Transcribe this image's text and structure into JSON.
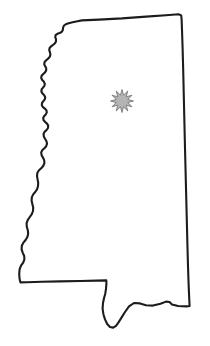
{
  "figure": {
    "kind": "map",
    "region_name": "Mississippi",
    "region_type": "state",
    "background_color": "#ffffff",
    "width": 210,
    "height": 346
  },
  "outline": {
    "name": "state-boundary",
    "stroke_color": "#1c1c1c",
    "fill_color": "#ffffff",
    "stroke_width": 2.1,
    "path": "M 77.5 21.2 L 82.0 20.4 L 99.0 19.6 L 122.0 18.4 L 146.0 16.6 L 166.0 15.2 L 178.5 14.3 L 181.2 15.4 L 181.6 19.0 L 182.0 30.0 L 182.6 48.0 L 183.2 70.0 L 183.8 96.0 L 184.4 122.0 L 185.0 148.0 L 185.6 172.0 L 186.2 196.0 L 186.8 220.0 L 187.4 244.0 L 188.0 266.0 L 188.6 284.0 L 189.2 298.0 L 189.6 306.0 L 186.5 306.4 L 178.0 306.0 L 172.0 304.5 L 169.5 302.0 L 166.0 301.6 L 160.5 303.8 L 153.0 305.6 L 146.0 305.2 L 140.0 303.4 L 134.0 303.0 L 129.0 306.4 L 125.0 312.0 L 121.5 317.6 L 118.5 322.4 L 116.0 325.8 L 113.2 327.6 L 110.0 327.0 L 107.2 324.0 L 105.0 319.4 L 103.4 314.2 L 102.6 308.6 L 103.0 303.0 L 104.0 298.2 L 105.2 294.0 L 106.0 288.8 L 106.4 283.6 L 106.3 280.4 L 97.0 280.6 L 80.0 281.0 L 60.0 281.4 L 42.0 281.8 L 27.0 282.2 L 20.5 282.4 L 19.6 279.0 L 19.2 274.0 L 19.6 269.4 L 21.0 265.6 L 23.2 262.6 L 24.4 259.4 L 24.2 256.0 L 22.8 252.8 L 21.6 249.4 L 21.8 245.8 L 23.4 242.6 L 25.6 240.0 L 27.4 237.0 L 28.2 233.6 L 27.8 230.2 L 26.8 226.8 L 26.6 223.2 L 27.8 219.8 L 29.8 217.0 L 31.8 214.2 L 33.0 211.0 L 33.2 207.6 L 32.4 204.2 L 31.6 200.8 L 31.8 197.4 L 33.2 194.4 L 35.2 192.0 L 37.0 189.4 L 38.0 186.2 L 38.2 182.8 L 37.6 179.4 L 37.0 176.0 L 37.4 172.8 L 39.0 170.2 L 41.2 168.2 L 43.2 166.0 L 44.4 163.2 L 44.2 160.2 L 43.0 157.6 L 41.6 155.2 L 41.2 152.4 L 42.4 150.0 L 44.4 148.2 L 46.2 146.2 L 47.0 143.6 L 46.4 141.0 L 45.0 138.8 L 43.8 136.4 L 43.6 133.8 L 44.8 131.6 L 46.6 130.0 L 48.0 128.0 L 48.2 125.6 L 47.0 123.6 L 45.2 122.0 L 43.6 120.2 L 43.2 118.0 L 44.2 116.0 L 45.8 114.4 L 46.8 112.4 L 46.4 110.2 L 44.8 108.6 L 43.0 107.2 L 41.8 105.2 L 42.0 103.0 L 43.4 101.2 L 44.8 99.4 L 45.2 97.2 L 44.2 95.2 L 42.6 93.6 L 41.4 91.6 L 41.6 89.4 L 43.0 87.6 L 44.4 85.8 L 44.8 83.6 L 43.8 81.6 L 42.2 80.0 L 41.2 78.0 L 41.6 75.8 L 43.2 74.0 L 45.0 72.4 L 46.2 70.4 L 46.2 68.2 L 45.2 66.2 L 44.2 64.2 L 44.6 62.0 L 46.2 60.2 L 48.2 58.6 L 49.8 56.8 L 50.4 54.6 L 50.0 52.4 L 49.2 50.2 L 49.6 48.0 L 51.2 46.2 L 53.2 44.8 L 55.0 43.2 L 56.0 41.2 L 56.0 39.2 L 55.2 37.2 L 55.6 35.2 L 57.4 33.8 L 59.6 33.0 L 61.6 32.0 L 62.8 30.2 L 63.0 28.0 L 63.8 25.8 L 65.8 24.2 L 68.6 23.2 L 72.6 22.2 Z"
  },
  "markers": [
    {
      "name": "capital-city-star",
      "label": "Jackson",
      "type": "starburst",
      "points": 12,
      "cx": 122,
      "cy": 101,
      "outer_radius": 11.5,
      "inner_radius": 6.0,
      "fill_color": "#b4b4b4",
      "stroke_color": "#6e6e6e"
    }
  ]
}
